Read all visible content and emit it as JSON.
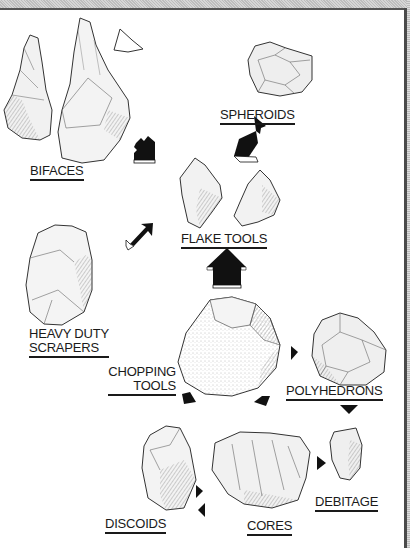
{
  "diagram": {
    "categories": [
      {
        "id": "bifaces",
        "label": "BIFACES"
      },
      {
        "id": "spheroids",
        "label": "SPHEROIDS"
      },
      {
        "id": "flake_tools",
        "label": "FLAKE TOOLS"
      },
      {
        "id": "heavy_duty_scrapers",
        "label_line1": "HEAVY DUTY",
        "label_line2": "SCRAPERS"
      },
      {
        "id": "chopping_tools",
        "label_line1": "CHOPPING",
        "label_line2": "TOOLS"
      },
      {
        "id": "polyhedrons",
        "label": "POLYHEDRONS"
      },
      {
        "id": "discoids",
        "label": "DISCOIDS"
      },
      {
        "id": "cores",
        "label": "CORES"
      },
      {
        "id": "debitage",
        "label": "DEBITAGE"
      }
    ],
    "arrows": [
      {
        "from": "chopping_tools",
        "to": "bifaces",
        "direction": "up-left"
      },
      {
        "from": "chopping_tools",
        "to": "spheroids",
        "direction": "down-left (toward flake tools)"
      },
      {
        "from": "heavy_duty_scrapers",
        "to": "flake_tools",
        "direction": "up-right"
      },
      {
        "from": "chopping_tools",
        "to": "flake_tools",
        "direction": "up"
      },
      {
        "from": "chopping_tools",
        "to": "polyhedrons",
        "direction": "right"
      },
      {
        "from": "polyhedrons",
        "to": "debitage",
        "direction": "down"
      },
      {
        "from": "chopping_tools",
        "to": "discoids",
        "direction": "down-left"
      },
      {
        "from": "chopping_tools",
        "to": "cores",
        "direction": "down-left"
      },
      {
        "from": "cores",
        "to": "debitage",
        "direction": "right"
      },
      {
        "from": "discoids",
        "to": "cores",
        "direction": "right"
      },
      {
        "from": "cores",
        "to": "discoids",
        "direction": "left"
      }
    ],
    "colors": {
      "ink": "#1a1a1a",
      "border": "#4a4a4a",
      "stone_shade": "#bdbdbd"
    }
  }
}
